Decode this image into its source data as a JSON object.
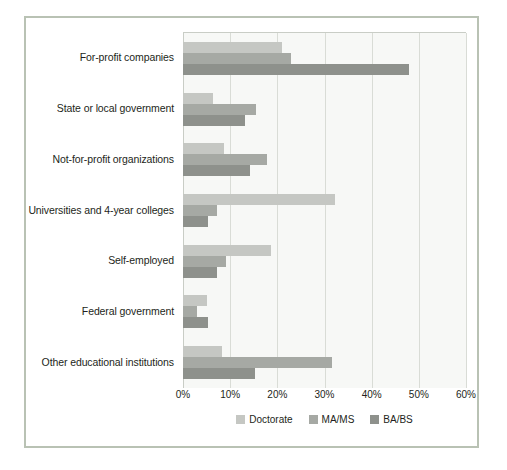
{
  "chart_data": {
    "type": "bar",
    "orientation": "horizontal",
    "title": "",
    "subtitle": "",
    "xlabel": "",
    "ylabel": "",
    "xlim": [
      0,
      60
    ],
    "xticks": [
      0,
      10,
      20,
      30,
      40,
      50,
      60
    ],
    "xticklabels": [
      "0%",
      "10%",
      "20%",
      "30%",
      "40%",
      "50%",
      "60%"
    ],
    "grid": true,
    "legend_position": "bottom",
    "categories": [
      "For-profit companies",
      "State or local government",
      "Not-for-profit organizations",
      "Universities and 4-year colleges",
      "Self-employed",
      "Federal government",
      "Other educational institutions"
    ],
    "series": [
      {
        "name": "Doctorate",
        "color": "#c5c7c3",
        "values": [
          21.0,
          6.4,
          8.7,
          32.2,
          18.7,
          5.1,
          8.2
        ]
      },
      {
        "name": "MA/MS",
        "color": "#a6a9a4",
        "values": [
          23.0,
          15.5,
          17.9,
          7.2,
          9.1,
          3.0,
          31.6
        ]
      },
      {
        "name": "BA/BS",
        "color": "#8e918c",
        "values": [
          47.9,
          13.1,
          14.3,
          5.2,
          7.2,
          5.3,
          15.3
        ]
      }
    ]
  },
  "colors": {
    "doctorate": "#c5c7c3",
    "ma_ms": "#a6a9a4",
    "ba_bs": "#8e918c",
    "plot_background": "#f7f8f6",
    "gridline": "#d9dcd6",
    "frame_border": "#b9c2b4",
    "text": "#231f20"
  }
}
